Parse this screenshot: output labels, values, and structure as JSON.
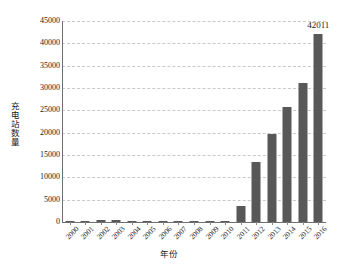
{
  "chart_data": {
    "type": "bar",
    "title": "",
    "subtitle": "",
    "xlabel": "年份",
    "ylabel": "充电站数量",
    "categories": [
      "2000",
      "2001",
      "2002",
      "2003",
      "2004",
      "2005",
      "2006",
      "2007",
      "2008",
      "2009",
      "2010",
      "2011",
      "2012",
      "2013",
      "2014",
      "2015",
      "2016"
    ],
    "values": [
      320,
      300,
      450,
      470,
      280,
      150,
      200,
      190,
      210,
      170,
      230,
      3500,
      13500,
      19600,
      25700,
      31100,
      42011
    ],
    "series": [
      {
        "name": "充电站数量",
        "values": [
          320,
          300,
          450,
          470,
          280,
          150,
          200,
          190,
          210,
          170,
          230,
          3500,
          13500,
          19600,
          25700,
          31100,
          42011
        ]
      }
    ],
    "ylim": [
      0,
      45000
    ],
    "ytick_values": [
      0,
      5000,
      10000,
      15000,
      20000,
      25000,
      30000,
      35000,
      40000,
      45000
    ],
    "ytick_labels": [
      "0",
      "5000",
      "10000",
      "15000",
      "20000",
      "25000",
      "30000",
      "35000",
      "40000",
      "45000"
    ],
    "grid": true,
    "grid_axis": "y",
    "grid_style": "dashed",
    "legend": false,
    "legend_position": "none",
    "bar_color": "#585858",
    "data_labels": [
      {
        "category": "2016",
        "value": 42011,
        "text": "42011"
      }
    ],
    "xtick_label_rotation": -45
  }
}
